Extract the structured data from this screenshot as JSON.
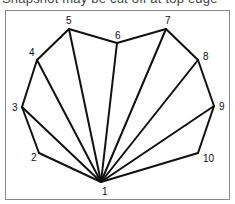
{
  "caption": {
    "text": "Snapshot may be cut off at top edge"
  },
  "diagram": {
    "type": "polygon-fan-triangulation",
    "stroke_color": "#111111",
    "frame_color": "#8a8a8a",
    "apex_vertex": "1",
    "vertices": [
      {
        "label": "1",
        "x": 101,
        "y": 182,
        "lx": 102,
        "ly": 195
      },
      {
        "label": "2",
        "x": 39,
        "y": 153,
        "lx": 31,
        "ly": 161
      },
      {
        "label": "3",
        "x": 22,
        "y": 107,
        "lx": 12,
        "ly": 111
      },
      {
        "label": "4",
        "x": 37,
        "y": 60,
        "lx": 29,
        "ly": 56
      },
      {
        "label": "5",
        "x": 69,
        "y": 29,
        "lx": 66,
        "ly": 24
      },
      {
        "label": "6",
        "x": 117,
        "y": 43,
        "lx": 115,
        "ly": 39
      },
      {
        "label": "7",
        "x": 166,
        "y": 29,
        "lx": 165,
        "ly": 24
      },
      {
        "label": "8",
        "x": 198,
        "y": 60,
        "lx": 203,
        "ly": 60
      },
      {
        "label": "9",
        "x": 214,
        "y": 106,
        "lx": 219,
        "ly": 110
      },
      {
        "label": "10",
        "x": 198,
        "y": 153,
        "lx": 203,
        "ly": 162
      }
    ],
    "edges_outline": [
      [
        "1",
        "2"
      ],
      [
        "2",
        "3"
      ],
      [
        "3",
        "4"
      ],
      [
        "4",
        "5"
      ],
      [
        "5",
        "6"
      ],
      [
        "6",
        "7"
      ],
      [
        "7",
        "8"
      ],
      [
        "8",
        "9"
      ],
      [
        "9",
        "10"
      ],
      [
        "10",
        "1"
      ]
    ],
    "edges_diagonal": [
      [
        "1",
        "3"
      ],
      [
        "1",
        "4"
      ],
      [
        "1",
        "5"
      ],
      [
        "1",
        "6"
      ],
      [
        "1",
        "7"
      ],
      [
        "1",
        "8"
      ],
      [
        "1",
        "9"
      ]
    ]
  }
}
